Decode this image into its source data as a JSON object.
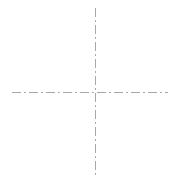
{
  "canvas": {
    "width": 181,
    "height": 184,
    "background_color": "#ffffff",
    "description": "centerline-crosshair"
  },
  "chart_data": {
    "type": "line",
    "title": "",
    "subtitle": "",
    "xlabel": "",
    "ylabel": "",
    "grid": false,
    "legend": null,
    "annotations": [],
    "tick_labels": {
      "x": [],
      "y": []
    },
    "xlim": [
      0,
      181
    ],
    "ylim": [
      0,
      184
    ],
    "origin": {
      "x": 95,
      "y": 92
    },
    "series": [
      {
        "name": "horizontal-centerline",
        "orientation": "horizontal",
        "x": [
          12,
          168
        ],
        "y": [
          92,
          92
        ],
        "color": "#a8a8a8",
        "width": 1,
        "style": "dash-dot",
        "dash_pattern": "9 3 2 3"
      },
      {
        "name": "vertical-centerline",
        "orientation": "vertical",
        "x": [
          95,
          95
        ],
        "y": [
          8,
          178
        ],
        "color": "#a8a8a8",
        "width": 1,
        "style": "dash-dot",
        "dash_pattern": "9 3 2 3"
      }
    ]
  },
  "styles": {
    "stroke_color": "#a8a8a8",
    "stroke_width": "1",
    "dash_array": "9 3 2 3",
    "linecap": "butt"
  },
  "geometry": {
    "horizontal": {
      "x1": "12",
      "y1": "92",
      "x2": "168",
      "y2": "92"
    },
    "vertical": {
      "x1": "95",
      "y1": "8",
      "x2": "95",
      "y2": "178"
    }
  }
}
